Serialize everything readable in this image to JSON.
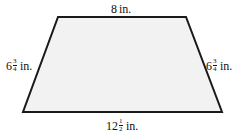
{
  "figure": {
    "shape": "isosceles trapezoid",
    "fill_color": "#f2f2f2",
    "stroke_color": "#1a1a1a",
    "vertices": {
      "top_left": [
        58,
        17
      ],
      "top_right": [
        186,
        17
      ],
      "bottom_right": [
        222,
        112
      ],
      "bottom_left": [
        23,
        112
      ]
    }
  },
  "labels": {
    "top": {
      "whole": "8",
      "unit": "in."
    },
    "left": {
      "whole": "6",
      "num": "3",
      "den": "4",
      "unit": "in."
    },
    "right": {
      "whole": "6",
      "num": "3",
      "den": "4",
      "unit": "in."
    },
    "bottom": {
      "whole": "12",
      "num": "1",
      "den": "2",
      "unit": "in."
    }
  }
}
